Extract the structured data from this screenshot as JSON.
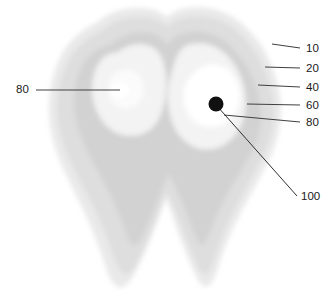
{
  "figure": {
    "background_color": "#ffffff",
    "contour_levels": [
      {
        "level": "10",
        "color": "#eaeaea"
      },
      {
        "level": "20",
        "color": "#e0e0e0"
      },
      {
        "level": "40",
        "color": "#d4d4d4"
      },
      {
        "level": "60",
        "color": "#f4f4f4"
      },
      {
        "level": "80",
        "color": "#fcfcfc"
      },
      {
        "level": "100",
        "color": "#111111"
      }
    ]
  },
  "labels": {
    "right": [
      {
        "text": "10",
        "x": 308,
        "y": 48,
        "line_x1": 272,
        "line_y1": 44,
        "line_x2": 300,
        "line_y2": 48
      },
      {
        "text": "20",
        "x": 308,
        "y": 68,
        "line_x1": 265,
        "line_y1": 67,
        "line_x2": 300,
        "line_y2": 68
      },
      {
        "text": "40",
        "x": 308,
        "y": 87,
        "line_x1": 258,
        "line_y1": 85,
        "line_x2": 300,
        "line_y2": 87
      },
      {
        "text": "60",
        "x": 308,
        "y": 105,
        "line_x1": 247,
        "line_y1": 104,
        "line_x2": 300,
        "line_y2": 105
      },
      {
        "text": "80",
        "x": 308,
        "y": 122,
        "line_x1": 224,
        "line_y1": 115,
        "line_x2": 300,
        "line_y2": 122
      }
    ],
    "left": [
      {
        "text": "80",
        "x": 16,
        "y": 93,
        "line_x1": 36,
        "line_y1": 90,
        "line_x2": 120,
        "line_y2": 90
      }
    ],
    "pointer": {
      "text": "100",
      "x": 303,
      "y": 200,
      "line_x1": 217,
      "line_y1": 106,
      "line_x2": 297,
      "line_y2": 196
    }
  },
  "markers": {
    "hot_spot": {
      "cx": 216,
      "cy": 104,
      "r": 7.5,
      "color": "#111111",
      "name": "100"
    },
    "left_void": {
      "cx": 120,
      "cy": 90,
      "rx": 10,
      "ry": 7.5,
      "color": "#ffffff",
      "name": "80"
    }
  }
}
